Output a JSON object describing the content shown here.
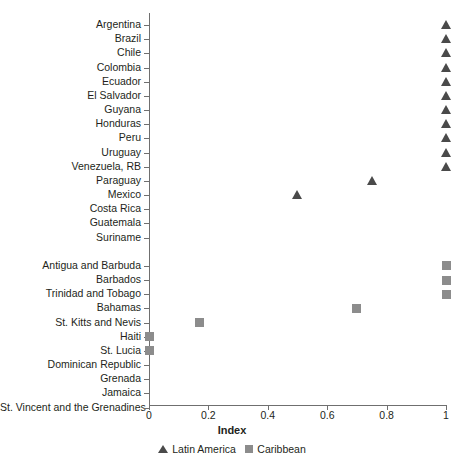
{
  "chart_data": {
    "type": "scatter",
    "title": "",
    "xlabel": "Index",
    "ylabel": "",
    "xlim": [
      0,
      1
    ],
    "grid": false,
    "legend_position": "bottom",
    "xticks": [
      "0",
      "0.2",
      "0.4",
      "0.6",
      "0.8",
      "1"
    ],
    "xtick_values": [
      0,
      0.2,
      0.4,
      0.6,
      0.8,
      1
    ],
    "categories": [
      "Argentina",
      "Brazil",
      "Chile",
      "Colombia",
      "Ecuador",
      "El Salvador",
      "Guyana",
      "Honduras",
      "Peru",
      "Uruguay",
      "Venezuela, RB",
      "Paraguay",
      "Mexico",
      "Costa Rica",
      "Guatemala",
      "Suriname",
      "Antigua and Barbuda",
      "Barbados",
      "Trinidad and Tobago",
      "Bahamas",
      "St. Kitts and Nevis",
      "Haiti",
      "St. Lucia",
      "Dominican Republic",
      "Grenada",
      "Jamaica",
      "St. Vincent and the Grenadines"
    ],
    "series": [
      {
        "name": "Latin America",
        "marker": "triangle",
        "color": "#4a4a4a",
        "points": [
          {
            "category": "Argentina",
            "value": 1.0
          },
          {
            "category": "Brazil",
            "value": 1.0
          },
          {
            "category": "Chile",
            "value": 1.0
          },
          {
            "category": "Colombia",
            "value": 1.0
          },
          {
            "category": "Ecuador",
            "value": 1.0
          },
          {
            "category": "El Salvador",
            "value": 1.0
          },
          {
            "category": "Guyana",
            "value": 1.0
          },
          {
            "category": "Honduras",
            "value": 1.0
          },
          {
            "category": "Peru",
            "value": 1.0
          },
          {
            "category": "Uruguay",
            "value": 1.0
          },
          {
            "category": "Venezuela, RB",
            "value": 1.0
          },
          {
            "category": "Paraguay",
            "value": 0.75
          },
          {
            "category": "Mexico",
            "value": 0.5
          },
          {
            "category": "Costa Rica",
            "value": null
          },
          {
            "category": "Guatemala",
            "value": null
          },
          {
            "category": "Suriname",
            "value": null
          }
        ]
      },
      {
        "name": "Caribbean",
        "marker": "square",
        "color": "#8c8c8c",
        "points": [
          {
            "category": "Antigua and Barbuda",
            "value": 1.0
          },
          {
            "category": "Barbados",
            "value": 1.0
          },
          {
            "category": "Trinidad and Tobago",
            "value": 1.0
          },
          {
            "category": "Bahamas",
            "value": 0.7
          },
          {
            "category": "St. Kitts and Nevis",
            "value": 0.17
          },
          {
            "category": "Haiti",
            "value": 0.0
          },
          {
            "category": "St. Lucia",
            "value": 0.0
          },
          {
            "category": "Dominican Republic",
            "value": null
          },
          {
            "category": "Grenada",
            "value": null
          },
          {
            "category": "Jamaica",
            "value": null
          },
          {
            "category": "St. Vincent and the Grenadines",
            "value": null
          }
        ]
      }
    ]
  },
  "legend": {
    "items": [
      {
        "label": "Latin America",
        "marker": "triangle"
      },
      {
        "label": "Caribbean",
        "marker": "square"
      }
    ]
  }
}
